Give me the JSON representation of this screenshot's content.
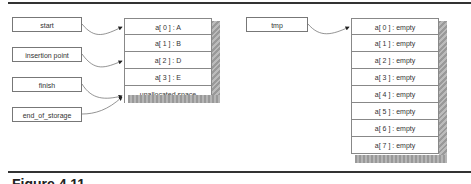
{
  "caption": "Figure 4.11",
  "left_diagram": {
    "pointers": [
      {
        "label": "start"
      },
      {
        "label": "insertion point"
      },
      {
        "label": "finish"
      },
      {
        "label": "end_of_storage"
      }
    ],
    "array": [
      {
        "label": "a[ 0 ] : A"
      },
      {
        "label": "a[ 1 ] : B"
      },
      {
        "label": "a[ 2 ] : D"
      },
      {
        "label": "a[ 3 ] : E"
      },
      {
        "label": "unallocated space"
      }
    ]
  },
  "right_diagram": {
    "pointers": [
      {
        "label": "tmp"
      }
    ],
    "array": [
      {
        "label": "a[ 0 ] : empty"
      },
      {
        "label": "a[ 1 ] : empty"
      },
      {
        "label": "a[ 2 ] : empty"
      },
      {
        "label": "a[ 3 ] : empty"
      },
      {
        "label": "a[ 4 ] : empty"
      },
      {
        "label": "a[ 5 ] : empty"
      },
      {
        "label": "a[ 6 ] : empty"
      },
      {
        "label": "a[ 7 ] : empty"
      }
    ]
  },
  "colors": {
    "rule": "#333333",
    "border": "#888888",
    "shadow": "#aaaaaa"
  }
}
